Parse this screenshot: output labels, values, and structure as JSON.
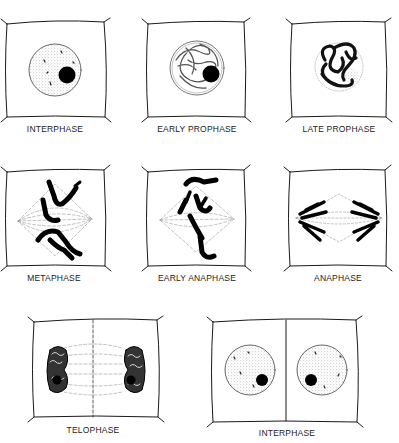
{
  "diagram": {
    "colors": {
      "ink": "#1a1a1a",
      "stipple": "#9a9a9a",
      "background": "#ffffff"
    },
    "stages": [
      {
        "id": "interphase-1",
        "label": "INTERPHASE",
        "row": 1
      },
      {
        "id": "early-prophase",
        "label": "EARLY PROPHASE",
        "row": 1
      },
      {
        "id": "late-prophase",
        "label": "LATE PROPHASE",
        "row": 1
      },
      {
        "id": "metaphase",
        "label": "METAPHASE",
        "row": 2
      },
      {
        "id": "early-anaphase",
        "label": "EARLY ANAPHASE",
        "row": 2
      },
      {
        "id": "anaphase",
        "label": "ANAPHASE",
        "row": 2
      },
      {
        "id": "telophase",
        "label": "TELOPHASE",
        "row": 3
      },
      {
        "id": "interphase-2",
        "label": "INTERPHASE",
        "row": 3
      }
    ]
  }
}
